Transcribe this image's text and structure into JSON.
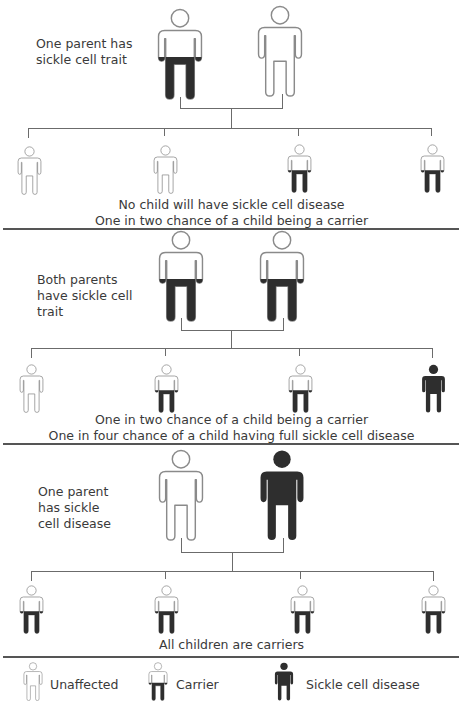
{
  "diagram": {
    "colors": {
      "carrier_fill": "#2e2e2e",
      "outline": "#8a8a8a",
      "line": "#6b6b6b"
    },
    "sections": [
      {
        "label": "One parent has\nsickle cell trait",
        "label_lines": [
          "One parent has",
          "sickle cell trait"
        ],
        "parents": [
          "carrier",
          "unaffected"
        ],
        "children": [
          "unaffected",
          "unaffected",
          "carrier",
          "carrier"
        ],
        "captions": [
          "No child will have sickle cell disease",
          "One in two chance of a child being a carrier"
        ]
      },
      {
        "label_lines": [
          "Both parents",
          "have sickle cell",
          "trait"
        ],
        "parents": [
          "carrier",
          "carrier"
        ],
        "children": [
          "unaffected",
          "carrier",
          "carrier",
          "disease"
        ],
        "captions": [
          "One in two chance of a child being a carrier",
          "One in four chance of a child having full sickle cell disease"
        ]
      },
      {
        "label_lines": [
          "One parent",
          "has sickle",
          "cell disease"
        ],
        "parents": [
          "unaffected",
          "disease"
        ],
        "children": [
          "carrier",
          "carrier",
          "carrier",
          "carrier"
        ],
        "captions": [
          "All children are carriers"
        ]
      }
    ],
    "legend": [
      {
        "type": "unaffected",
        "label": "Unaffected"
      },
      {
        "type": "carrier",
        "label": "Carrier"
      },
      {
        "type": "disease",
        "label": "Sickle cell disease"
      }
    ]
  }
}
